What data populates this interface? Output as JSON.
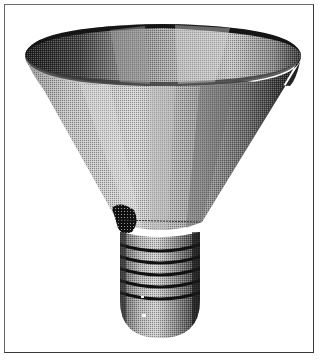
{
  "figure": {
    "render_style": "monochrome-dither",
    "thread_count": 5,
    "colors": {
      "background": "#ffffff",
      "frame": "#5a5a5a",
      "dark": "#1a1a1a",
      "mid": "#7a7a7a",
      "light": "#c8c8c8",
      "highlight": "#e6e6e6"
    }
  },
  "caption": ""
}
